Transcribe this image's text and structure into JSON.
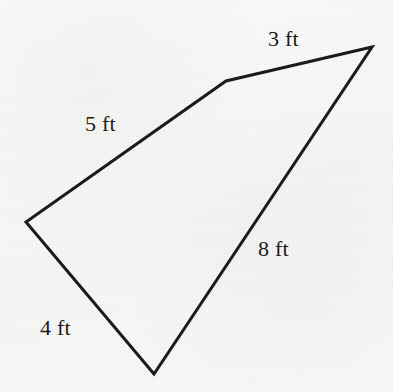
{
  "figure": {
    "kind": "quadrilateral-diagram",
    "units": "ft",
    "background_color": "#f8f8f7",
    "stroke_color": "#1b1b1b",
    "stroke_width": 3,
    "canvas": {
      "width": 393,
      "height": 392
    },
    "vertices": [
      {
        "name": "apex-right",
        "x": 372,
        "y": 47
      },
      {
        "name": "bend-top",
        "x": 226,
        "y": 81
      },
      {
        "name": "vertex-left",
        "x": 26,
        "y": 222
      },
      {
        "name": "vertex-bottom",
        "x": 154,
        "y": 374
      }
    ],
    "polygon_points": "372,47 226,81 26,222 154,374",
    "sides": [
      {
        "name": "side-top-right",
        "label": "3 ft",
        "from": "bend-top",
        "to": "apex-right",
        "label_x": 268,
        "label_y": 28
      },
      {
        "name": "side-upper-left",
        "label": "5 ft",
        "from": "vertex-left",
        "to": "bend-top",
        "label_x": 85,
        "label_y": 113
      },
      {
        "name": "side-right",
        "label": "8 ft",
        "from": "apex-right",
        "to": "vertex-bottom",
        "label_x": 258,
        "label_y": 238
      },
      {
        "name": "side-lower-left",
        "label": "4 ft",
        "from": "vertex-left",
        "to": "vertex-bottom",
        "label_x": 40,
        "label_y": 317
      }
    ]
  },
  "chart_data": {
    "type": "diagram",
    "title": "",
    "shape": "irregular quadrilateral",
    "side_labels": [
      "3 ft",
      "5 ft",
      "8 ft",
      "4 ft"
    ],
    "side_lengths": [
      3,
      5,
      8,
      4
    ],
    "units": "ft",
    "perimeter": 20
  }
}
